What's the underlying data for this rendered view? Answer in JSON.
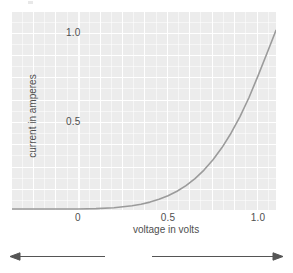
{
  "figure": {
    "kind": "diode-iv-characteristic-curve"
  },
  "chart_data": {
    "type": "line",
    "title": "",
    "xlabel": "voltage in volts",
    "ylabel": "current in amperes",
    "xlim": [
      -0.37,
      1.1
    ],
    "ylim": [
      -0.01,
      1.12
    ],
    "xticks": [
      "0",
      "0.5",
      "1.0"
    ],
    "xtick_values": [
      0,
      0.5,
      1.0
    ],
    "yticks": [
      "0.5",
      "1.0"
    ],
    "ytick_values": [
      0.5,
      1.0
    ],
    "grid": true,
    "grid_color": "#ffffff",
    "background": "#ececec",
    "legend": "none",
    "series": [
      {
        "name": "diode current",
        "color": "#9b9b9b",
        "x": [
          -0.37,
          -0.3,
          -0.2,
          -0.1,
          0.0,
          0.1,
          0.2,
          0.3,
          0.35,
          0.4,
          0.45,
          0.5,
          0.55,
          0.6,
          0.65,
          0.7,
          0.75,
          0.8,
          0.85,
          0.9,
          0.95,
          1.0,
          1.05,
          1.1
        ],
        "y": [
          0.0,
          0.0,
          0.0,
          0.0,
          0.0,
          0.002,
          0.007,
          0.018,
          0.027,
          0.039,
          0.055,
          0.075,
          0.1,
          0.132,
          0.172,
          0.22,
          0.278,
          0.347,
          0.428,
          0.522,
          0.63,
          0.752,
          0.88,
          1.01
        ]
      }
    ],
    "annotations": [
      {
        "name": "zero-voltage-line",
        "type": "vline",
        "x": 0.0,
        "color": "#fdfdfd"
      }
    ]
  },
  "axes": {
    "y": {
      "label": "current in amperes",
      "tick_1_0": "1.0",
      "tick_0_5": "0.5"
    },
    "x": {
      "label": "voltage in volts",
      "tick_0": "0",
      "tick_0_5": "0.5",
      "tick_1_0": "1.0"
    }
  },
  "bias": {
    "reverse": "reverse\nbias",
    "reverse_line1": "reverse",
    "reverse_line2": "bias",
    "forward": "forward\nbias",
    "forward_line1": "forward",
    "forward_line2": "bias"
  },
  "colors": {
    "panel": "#ececec",
    "grid": "#ffffff",
    "curve": "#9b9b9b",
    "text": "#4f4f4f",
    "arrow": "#555555"
  }
}
